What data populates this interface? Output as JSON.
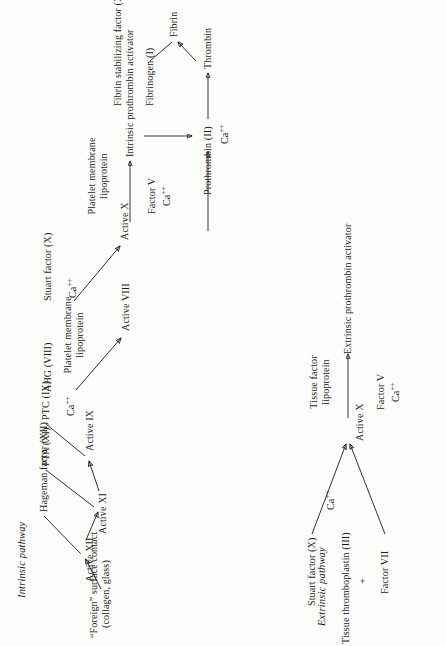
{
  "figure": {
    "background_color": "#fdfdfc",
    "ink_color": "#1b1b1b",
    "orientation": "rotated-90-ccw"
  },
  "intrinsic": {
    "header": "Intrinsic pathway",
    "trigger_line1": "“Foreign” surface contact",
    "trigger_line2": "(collagen, glass)",
    "hageman_factor": "Hageman factor (XII)",
    "active_xii": "Active XII",
    "pta": "PTA (XI)",
    "active_xi": "Active XI",
    "ptc": "PTC (IX)",
    "calcium_ix": "Ca",
    "calcium_ix_sup": "++",
    "active_ix": "Active IX",
    "ahg": "AHG (VIII)",
    "platelet_lipo_line1": "Platelet membrane",
    "platelet_lipo_line2": "lipoprotein",
    "active_viii": "Active VIII",
    "stuart_factor": "Stuart factor (X)",
    "calcium_x": "Ca",
    "calcium_x_sup": "++",
    "active_x": "Active X",
    "platelet_lipo2_line1": "Platelet membrane",
    "platelet_lipo2_line2": "lipoprotein",
    "factor_v": "Factor V",
    "factor_v_ca": "Ca",
    "factor_v_ca_sup": "++",
    "prothrombin_activator": "Intrinsic prothrombin activator"
  },
  "extrinsic": {
    "header": "Extrinsic pathway",
    "tissue_thromboplastin": "Tissue thromboplastin (III)",
    "plus": "+",
    "factor_vii": "Factor VII",
    "stuart_factor": "Stuart factor (X)",
    "calcium": "Ca",
    "calcium_sup": "++",
    "active_x": "Active X",
    "tissue_factor_line1": "Tissue factor",
    "tissue_factor_line2": "lipoprotein",
    "factor_v": "Factor V",
    "factor_v_ca": "Ca",
    "factor_v_ca_sup": "++",
    "prothrombin_activator": "Extrinsic prothrombin activator"
  },
  "common": {
    "prothrombin": "Prothrombin (II)",
    "calcium": "Ca",
    "calcium_sup": "++",
    "thrombin": "Thrombin",
    "fibrinogen": "Fibrinogen (I)",
    "fibrin": "Fibrin",
    "fibrin_stabilizing_factor": "Fibrin stabilizing factor (XIII)"
  }
}
